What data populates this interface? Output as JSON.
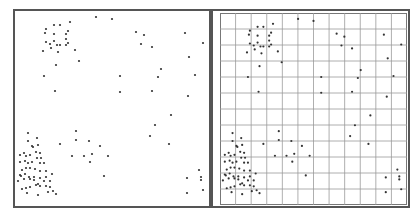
{
  "colors": {
    "border": "#555555",
    "grid": "#9a9a9a",
    "point": "#333333",
    "background": "#ffffff"
  },
  "panels": [
    {
      "name": "raw-points",
      "grid": false
    },
    {
      "name": "gridded-points",
      "grid": true,
      "grid_cols": 12,
      "grid_rows": 12
    }
  ],
  "points": [
    [
      46,
      29
    ],
    [
      54,
      25
    ],
    [
      60,
      25
    ],
    [
      70,
      22
    ],
    [
      45,
      33
    ],
    [
      54,
      34
    ],
    [
      66,
      34
    ],
    [
      68,
      31
    ],
    [
      46,
      42
    ],
    [
      54,
      41
    ],
    [
      50,
      44
    ],
    [
      57,
      45
    ],
    [
      60,
      45
    ],
    [
      66,
      45
    ],
    [
      68,
      43
    ],
    [
      43,
      51
    ],
    [
      51,
      48
    ],
    [
      58,
      52
    ],
    [
      66,
      39
    ],
    [
      75,
      50
    ],
    [
      79,
      61
    ],
    [
      56,
      65
    ],
    [
      44,
      76
    ],
    [
      55,
      91
    ],
    [
      96,
      17
    ],
    [
      112,
      19
    ],
    [
      136,
      32
    ],
    [
      144,
      35
    ],
    [
      141,
      44
    ],
    [
      152,
      47
    ],
    [
      185,
      33
    ],
    [
      203,
      43
    ],
    [
      189,
      57
    ],
    [
      161,
      69
    ],
    [
      158,
      77
    ],
    [
      195,
      75
    ],
    [
      120,
      76
    ],
    [
      120,
      92
    ],
    [
      152,
      91
    ],
    [
      188,
      96
    ],
    [
      28,
      133
    ],
    [
      28,
      141
    ],
    [
      37,
      138
    ],
    [
      38,
      145
    ],
    [
      32,
      146
    ],
    [
      33,
      147
    ],
    [
      20,
      155
    ],
    [
      24,
      153
    ],
    [
      26,
      156
    ],
    [
      30,
      155
    ],
    [
      36,
      152
    ],
    [
      40,
      153
    ],
    [
      41,
      158
    ],
    [
      20,
      162
    ],
    [
      25,
      161
    ],
    [
      28,
      163
    ],
    [
      32,
      162
    ],
    [
      37,
      158
    ],
    [
      40,
      163
    ],
    [
      44,
      163
    ],
    [
      22,
      170
    ],
    [
      26,
      168
    ],
    [
      30,
      168
    ],
    [
      35,
      169
    ],
    [
      40,
      171
    ],
    [
      46,
      171
    ],
    [
      20,
      175
    ],
    [
      21,
      176
    ],
    [
      25,
      174
    ],
    [
      29,
      177
    ],
    [
      34,
      177
    ],
    [
      40,
      178
    ],
    [
      46,
      177
    ],
    [
      52,
      174
    ],
    [
      18,
      181
    ],
    [
      24,
      179
    ],
    [
      30,
      179
    ],
    [
      34,
      180
    ],
    [
      38,
      184
    ],
    [
      44,
      181
    ],
    [
      50,
      181
    ],
    [
      22,
      189
    ],
    [
      26,
      188
    ],
    [
      30,
      187
    ],
    [
      36,
      185
    ],
    [
      40,
      186
    ],
    [
      46,
      186
    ],
    [
      50,
      187
    ],
    [
      27,
      193
    ],
    [
      38,
      195
    ],
    [
      48,
      192
    ],
    [
      53,
      191
    ],
    [
      56,
      194
    ],
    [
      60,
      144
    ],
    [
      76,
      131
    ],
    [
      76,
      140
    ],
    [
      72,
      156
    ],
    [
      84,
      156
    ],
    [
      89,
      141
    ],
    [
      92,
      154
    ],
    [
      90,
      162
    ],
    [
      100,
      146
    ],
    [
      108,
      156
    ],
    [
      104,
      176
    ],
    [
      150,
      136
    ],
    [
      155,
      125
    ],
    [
      171,
      115
    ],
    [
      169,
      144
    ],
    [
      187,
      178
    ],
    [
      199,
      170
    ],
    [
      201,
      177
    ],
    [
      187,
      193
    ],
    [
      201,
      180
    ],
    [
      203,
      190
    ]
  ],
  "grid_points_offset": {
    "x": 211,
    "y": 0
  }
}
